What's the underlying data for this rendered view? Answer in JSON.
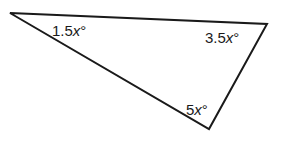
{
  "diagram": {
    "type": "triangle",
    "stroke_color": "#1a1a1a",
    "vertices": {
      "top_left": [
        10,
        13
      ],
      "top_right": [
        267,
        24
      ],
      "bottom": [
        209,
        129
      ]
    },
    "angles": [
      {
        "vertex": "top_left",
        "coef": "1.5",
        "var": "x",
        "unit": "°"
      },
      {
        "vertex": "top_right",
        "coef": "3.5",
        "var": "x",
        "unit": "°"
      },
      {
        "vertex": "bottom",
        "coef": "5",
        "var": "x",
        "unit": "°"
      }
    ]
  }
}
